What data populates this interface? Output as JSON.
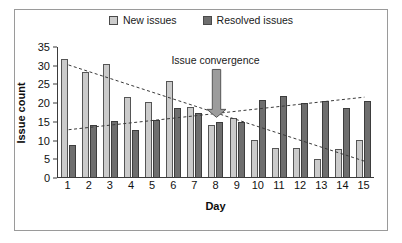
{
  "legend": {
    "entries": [
      {
        "label": "New issues",
        "color": "#cbcbcb",
        "icon": "legend-swatch-new"
      },
      {
        "label": "Resolved issues",
        "color": "#6e6e6e",
        "icon": "legend-swatch-resolved"
      }
    ]
  },
  "annotation": {
    "text": "Issue convergence",
    "icon": "down-arrow-icon"
  },
  "chart_data": {
    "type": "bar",
    "title": "",
    "xlabel": "Day",
    "ylabel": "Issue count",
    "categories": [
      "1",
      "2",
      "3",
      "4",
      "5",
      "6",
      "7",
      "8",
      "9",
      "10",
      "11",
      "12",
      "13",
      "14",
      "15"
    ],
    "series": [
      {
        "name": "New issues",
        "color": "#cbcbcb",
        "values": [
          31.5,
          28,
          30.3,
          21.3,
          20,
          25.7,
          18.7,
          14,
          15.8,
          10,
          7.8,
          7.7,
          4.7,
          7.5,
          9.8
        ]
      },
      {
        "name": "Resolved issues",
        "color": "#6e6e6e",
        "values": [
          8.5,
          14,
          15,
          12.6,
          15.1,
          18.5,
          17.2,
          14.8,
          14.8,
          20.6,
          21.7,
          19.7,
          20.4,
          18.5,
          20.3
        ]
      }
    ],
    "ylim": [
      0,
      35
    ],
    "yticks": [
      0,
      5,
      10,
      15,
      20,
      25,
      30,
      35
    ],
    "grid": false,
    "legend_position": "top-center",
    "trendlines": [
      {
        "name": "New issues trend",
        "style": "dashed",
        "x_start": 1,
        "y_start": 30.2,
        "x_end": 15,
        "y_end": 4.5
      },
      {
        "name": "Resolved issues trend",
        "style": "dashed",
        "x_start": 1,
        "y_start": 12.9,
        "x_end": 15,
        "y_end": 21.6
      }
    ],
    "annotations": [
      {
        "text": "Issue convergence",
        "x": 8,
        "y": 29
      }
    ]
  }
}
